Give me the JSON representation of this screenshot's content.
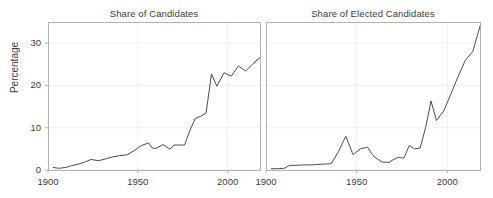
{
  "figure": {
    "background": "#ffffff",
    "line_color": "#4d4d4d",
    "axis_color": "#b3b3b3",
    "grid_color": "#f0f0f0",
    "text_color": "#3d3d3d",
    "ylabel": "Percentage"
  },
  "panels": {
    "left": {
      "title": "Share of Candidates",
      "yticks": [
        "0",
        "10",
        "20",
        "30"
      ],
      "xticks": [
        "1900",
        "1950",
        "2000"
      ]
    },
    "right": {
      "title": "Share of Elected Candidates",
      "xticks": [
        "1900",
        "1950",
        "2000"
      ]
    }
  },
  "chart_data": [
    {
      "type": "line",
      "title": "Share of Candidates",
      "xlabel": "",
      "ylabel": "Percentage",
      "xlim": [
        1900,
        2018
      ],
      "ylim": [
        0,
        35
      ],
      "xticks": [
        1900,
        1950,
        2000
      ],
      "yticks": [
        0,
        10,
        20,
        30
      ],
      "grid": true,
      "legend": "none",
      "series": [
        {
          "name": "Share of Candidates",
          "x": [
            1903,
            1906,
            1910,
            1913,
            1917,
            1920,
            1924,
            1928,
            1932,
            1936,
            1940,
            1944,
            1948,
            1952,
            1956,
            1958,
            1960,
            1964,
            1968,
            1970,
            1973,
            1976,
            1979,
            1982,
            1985,
            1988,
            1991,
            1994,
            1998,
            2002,
            2006,
            2010,
            2014,
            2018
          ],
          "y": [
            0.6,
            0.4,
            0.6,
            1.0,
            1.4,
            1.8,
            2.5,
            2.2,
            2.6,
            3.1,
            3.4,
            3.6,
            4.6,
            5.8,
            6.4,
            5.2,
            5.1,
            6.0,
            4.9,
            5.9,
            5.9,
            5.9,
            9.4,
            12.2,
            12.7,
            13.5,
            22.7,
            19.8,
            23.0,
            22.2,
            24.6,
            23.4,
            25.1,
            26.6
          ]
        }
      ]
    },
    {
      "type": "line",
      "title": "Share of Elected Candidates",
      "xlabel": "",
      "ylabel": "Percentage",
      "xlim": [
        1900,
        2018
      ],
      "ylim": [
        0,
        35
      ],
      "xticks": [
        1900,
        1950,
        2000
      ],
      "yticks": [
        0,
        10,
        20,
        30
      ],
      "grid": true,
      "legend": "none",
      "series": [
        {
          "name": "Share of Elected Candidates",
          "x": [
            1903,
            1906,
            1910,
            1913,
            1917,
            1920,
            1924,
            1928,
            1932,
            1936,
            1940,
            1944,
            1948,
            1952,
            1956,
            1958,
            1960,
            1964,
            1968,
            1970,
            1973,
            1976,
            1979,
            1982,
            1985,
            1988,
            1991,
            1994,
            1998,
            2002,
            2006,
            2010,
            2014,
            2018
          ],
          "y": [
            0.3,
            0.3,
            0.4,
            1.1,
            1.1,
            1.2,
            1.2,
            1.3,
            1.4,
            1.5,
            4.4,
            8.0,
            3.6,
            5.0,
            5.4,
            4.0,
            3.0,
            1.9,
            1.8,
            2.4,
            3.0,
            2.8,
            5.8,
            5.0,
            5.2,
            10.0,
            16.3,
            11.7,
            14.0,
            18.0,
            22.2,
            26.0,
            28.0,
            34.0
          ]
        }
      ]
    }
  ]
}
